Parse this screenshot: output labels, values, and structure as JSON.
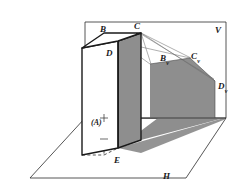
{
  "figure": {
    "background_color": "#ffffff",
    "line_color": "#1a1a1a",
    "shadow_color": "#8c8c8c",
    "prism_face_color": "#8c8c8c",
    "labels": {
      "plane_vertical": "V",
      "plane_horizontal": "H",
      "vertex_b": "B",
      "vertex_c": "C",
      "vertex_d": "D",
      "vertex_e": "E",
      "vertex_a_hidden": "(A)",
      "shadow_b_letter": "B",
      "shadow_b_sub": "v",
      "shadow_c_letter": "C",
      "shadow_c_sub": "v",
      "shadow_d_letter": "D",
      "shadow_d_sub": "v"
    },
    "geometry": {
      "v_plane": "85,22 226,22 226,118 85,118",
      "h_plane": "85,118 226,118 186,178 30,178",
      "ground_line": "85,118 226,118",
      "prism_front_face": "82,48 118,41 118,148 82,155",
      "prism_right_face": "118,41 141,33 141,140 118,148",
      "prism_top_face": "82,48 104,33 141,33 118,41",
      "shadow_on_v": "150,63 190,57 214,80 214,118 150,118",
      "shadow_on_ground": "118,148 141,140 222,118 160,118",
      "rays": [
        "141,33 190,57",
        "141,33 214,80",
        "118,41 150,63",
        "141,33 150,63"
      ]
    }
  }
}
